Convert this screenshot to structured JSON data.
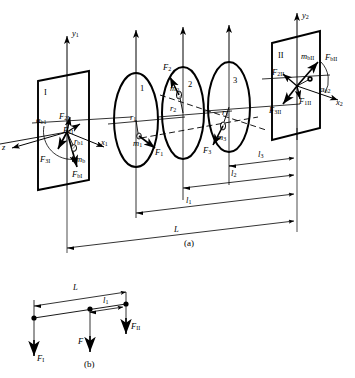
{
  "figure": {
    "background": "#ffffff",
    "stroke": "#000000",
    "captions": {
      "a": "(a)",
      "b": "(b)"
    }
  },
  "panel_a": {
    "plane_I": {
      "name": "I",
      "axes": {
        "y": "y",
        "y_sub": "1",
        "x": "x",
        "x_sub": "1",
        "z": "z"
      },
      "labels": [
        {
          "name": "alpha-b1",
          "base": "α",
          "sub": "b1"
        },
        {
          "name": "F-2I",
          "base": "F",
          "sub": "2I"
        },
        {
          "name": "F-1I",
          "base": "F",
          "sub": "1I"
        },
        {
          "name": "r-b1",
          "base": "r",
          "sub": "b1"
        },
        {
          "name": "F-3I",
          "base": "F",
          "sub": "3I"
        },
        {
          "name": "m-b",
          "base": "m",
          "sub": "b"
        },
        {
          "name": "F-bI",
          "base": "F",
          "sub": "bI"
        }
      ]
    },
    "plane_II": {
      "name": "II",
      "axes": {
        "y": "y",
        "y_sub": "2",
        "x": "x",
        "x_sub": "2"
      },
      "labels": [
        {
          "name": "m-bII",
          "base": "m",
          "sub": "bII"
        },
        {
          "name": "F-bII",
          "base": "F",
          "sub": "bII"
        },
        {
          "name": "F-2II",
          "base": "F",
          "sub": "2II"
        },
        {
          "name": "F-1II",
          "base": "F",
          "sub": "1II"
        },
        {
          "name": "F-3II",
          "base": "F",
          "sub": "3II"
        },
        {
          "name": "alpha-b2",
          "base": "α",
          "sub": "b2"
        }
      ]
    },
    "discs": [
      {
        "number": "1",
        "radius_label": {
          "base": "r",
          "sub": "1"
        },
        "mass_label": {
          "base": "m",
          "sub": "1"
        },
        "force_label": {
          "base": "F",
          "sub": "1"
        }
      },
      {
        "number": "2",
        "radius_label": {
          "base": "r",
          "sub": "2"
        },
        "mass_label": {
          "base": "m",
          "sub": "2"
        },
        "force_label": {
          "base": "F",
          "sub": "2"
        }
      },
      {
        "number": "3",
        "radius_label": {
          "base": "r",
          "sub": "3"
        },
        "mass_label": {
          "base": "m",
          "sub": "3"
        },
        "force_label": {
          "base": "F",
          "sub": "3"
        }
      }
    ],
    "dimensions": [
      {
        "name": "l3",
        "base": "l",
        "sub": "3"
      },
      {
        "name": "l2",
        "base": "l",
        "sub": "2"
      },
      {
        "name": "l1",
        "base": "l",
        "sub": "1"
      },
      {
        "name": "L",
        "base": "L",
        "sub": ""
      }
    ]
  },
  "panel_b": {
    "dimensions": [
      {
        "name": "L",
        "base": "L",
        "sub": ""
      },
      {
        "name": "l1",
        "base": "l",
        "sub": "1"
      }
    ],
    "forces": [
      {
        "name": "F-I",
        "base": "F",
        "sub": "I"
      },
      {
        "name": "F",
        "base": "F",
        "sub": ""
      },
      {
        "name": "F-II",
        "base": "F",
        "sub": "II"
      }
    ]
  }
}
